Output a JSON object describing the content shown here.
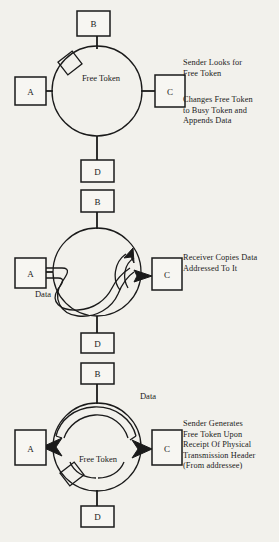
{
  "diagram": {
    "colors": {
      "background": "#f2f1ec",
      "stroke": "#1a1a1a",
      "box_fill": "#f7f6f2"
    },
    "stages": [
      {
        "id": "stage-1",
        "ring_label": "Free Token",
        "nodes": [
          {
            "id": "b",
            "label": "B"
          },
          {
            "id": "a",
            "label": "A"
          },
          {
            "id": "c",
            "label": "C"
          },
          {
            "id": "d",
            "label": "D"
          }
        ],
        "captions": [
          "Sender Looks for\nFree Token",
          "Changes Free Token\nto Busy Token and\nAppends Data"
        ],
        "token_marker": "free-token-square"
      },
      {
        "id": "stage-2",
        "ring_label": "",
        "data_label": "Data",
        "nodes": [
          {
            "id": "b",
            "label": "B"
          },
          {
            "id": "a",
            "label": "A"
          },
          {
            "id": "c",
            "label": "C"
          },
          {
            "id": "d",
            "label": "D"
          }
        ],
        "captions": [
          "Receiver Copies Data\nAddressed To It"
        ],
        "token_marker": "none"
      },
      {
        "id": "stage-3",
        "ring_label": "Free Token",
        "data_label": "Data",
        "nodes": [
          {
            "id": "b",
            "label": "B"
          },
          {
            "id": "a",
            "label": "A"
          },
          {
            "id": "c",
            "label": "C"
          },
          {
            "id": "d",
            "label": "D"
          }
        ],
        "captions": [
          "Sender Generates\nFree Token Upon\nReceipt Of Physical\nTransmission Header\n(From addressee)"
        ],
        "token_marker": "free-token-square"
      }
    ],
    "between_labels": {
      "d_after_ring1": "D",
      "b_before_ring2": "B",
      "d_after_ring2": "D",
      "b_before_ring3": "B",
      "d_after_ring3": "D"
    }
  }
}
